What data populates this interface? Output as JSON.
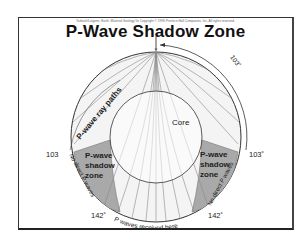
{
  "credit_line": "Tarbuck/Lutgens, Earth: Material Geology 5e Copyright © 1996 Prentice-Hall Companies, Inc. All rights reserved.",
  "title": "P-Wave Shadow Zone",
  "labels": {
    "ray_paths": "P-wave ray paths",
    "core": "Core",
    "shadow_left_1": "P-wave",
    "shadow_left_2": "shadow",
    "shadow_left_3": "zone",
    "shadow_right_1": "P-wave",
    "shadow_right_2": "shadow",
    "shadow_right_3": "zone",
    "no_direct_left": "No direct P waves",
    "no_direct_right": "No direct P waves",
    "received": "P waves received here"
  },
  "angles": {
    "top_arc": "103˚",
    "left_103": "103",
    "right_103": "103˚",
    "left_142": "142˚",
    "right_142": "142˚"
  },
  "colors": {
    "shadow_fill": "#a9a9a9",
    "ray_color": "#8a8a8a",
    "outline": "#333333"
  }
}
